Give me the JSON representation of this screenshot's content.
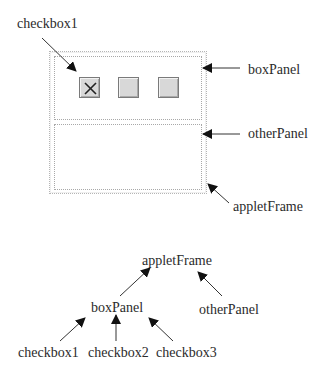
{
  "window_diagram": {
    "applet_frame_label": "appletFrame",
    "box_panel_label": "boxPanel",
    "other_panel_label": "otherPanel",
    "checkbox_callout_label": "checkbox1",
    "checkboxes": [
      {
        "name": "checkbox1",
        "checked": true,
        "mark": "X"
      },
      {
        "name": "checkbox2",
        "checked": false
      },
      {
        "name": "checkbox3",
        "checked": false
      }
    ]
  },
  "tree": {
    "root": "appletFrame",
    "children": [
      {
        "label": "boxPanel",
        "children": [
          "checkbox1",
          "checkbox2",
          "checkbox3"
        ]
      },
      {
        "label": "otherPanel"
      }
    ]
  },
  "colors": {
    "frame_border": "#a8a8a8",
    "checkbox_fill": "#d8d8d8",
    "text": "#2b2b2b"
  }
}
